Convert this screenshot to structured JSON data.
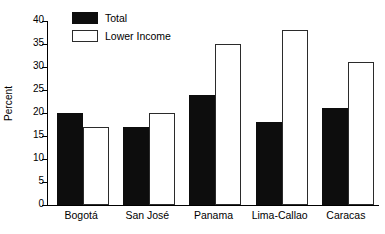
{
  "chart_data": {
    "type": "bar",
    "title": "",
    "subtitle": "",
    "xlabel": "",
    "ylabel": "Percent",
    "ylim": [
      0,
      40
    ],
    "yticks": [
      0,
      5,
      10,
      15,
      20,
      25,
      30,
      35,
      40
    ],
    "grid": false,
    "legend_position": "top-left",
    "categories": [
      "Bogotá",
      "San José",
      "Panama",
      "Lima-Callao",
      "Caracas"
    ],
    "series": [
      {
        "name": "Total",
        "color": "#0d0d0d",
        "values": [
          20,
          17,
          24,
          18,
          21
        ]
      },
      {
        "name": "Lower Income",
        "color": "#ffffff",
        "values": [
          17,
          20,
          35,
          38,
          31
        ]
      }
    ],
    "annotations": []
  },
  "legend": {
    "items": [
      {
        "label": "Total",
        "swatch": "filled-black-swatch"
      },
      {
        "label": "Lower Income",
        "swatch": "outlined-white-swatch"
      }
    ]
  }
}
